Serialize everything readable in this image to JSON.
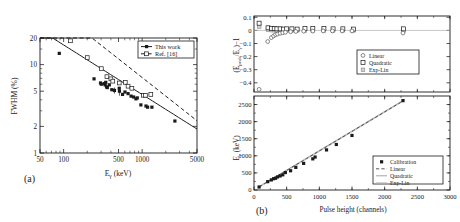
{
  "figure": {
    "caption_a": "(a)",
    "caption_b": "(b)"
  },
  "chart_data": [
    {
      "id": "panel-a",
      "type": "scatter",
      "panel_label": "(a)",
      "title": "",
      "xlabel": "Eγ (keV)",
      "xlabel_base": "E",
      "xlabel_sub": "γ",
      "xlabel_unit": " (keV)",
      "ylabel": "FWHM (%)",
      "xscale": "log",
      "yscale": "log",
      "xlim": [
        50,
        5000
      ],
      "ylim": [
        1,
        20
      ],
      "xticks": [
        50,
        100,
        500,
        1000,
        5000
      ],
      "xticklabels": [
        "50",
        "100",
        "500",
        "1000",
        "5000"
      ],
      "yticks": [
        1,
        2,
        5,
        10,
        20
      ],
      "yticklabels": [
        "1",
        "2",
        "5",
        "10",
        "20"
      ],
      "grid": false,
      "legend_position": "upper-right",
      "series": [
        {
          "name": "This work",
          "marker": "filled-square",
          "line": "solid",
          "points": [
            {
              "x": 88,
              "y": 13.4
            },
            {
              "x": 244,
              "y": 6.9
            },
            {
              "x": 295,
              "y": 6.2
            },
            {
              "x": 302,
              "y": 6.0
            },
            {
              "x": 330,
              "y": 6.1
            },
            {
              "x": 338,
              "y": 5.9
            },
            {
              "x": 344,
              "y": 6.3
            },
            {
              "x": 352,
              "y": 5.6
            },
            {
              "x": 360,
              "y": 5.5
            },
            {
              "x": 382,
              "y": 5.9
            },
            {
              "x": 411,
              "y": 5.2
            },
            {
              "x": 444,
              "y": 5.1
            },
            {
              "x": 511,
              "y": 5.4
            },
            {
              "x": 514,
              "y": 5.0
            },
            {
              "x": 563,
              "y": 4.6
            },
            {
              "x": 605,
              "y": 4.9
            },
            {
              "x": 662,
              "y": 4.7
            },
            {
              "x": 723,
              "y": 4.4
            },
            {
              "x": 779,
              "y": 4.3
            },
            {
              "x": 834,
              "y": 4.1
            },
            {
              "x": 867,
              "y": 4.2
            },
            {
              "x": 964,
              "y": 3.5
            },
            {
              "x": 1120,
              "y": 3.4
            },
            {
              "x": 1173,
              "y": 3.3
            },
            {
              "x": 1332,
              "y": 3.3
            },
            {
              "x": 2614,
              "y": 2.3
            }
          ],
          "fit_label": "power-law"
        },
        {
          "name": "Ref. [16]",
          "marker": "open-square",
          "line": "dashed",
          "points": [
            {
              "x": 122,
              "y": 18.6
            },
            {
              "x": 200,
              "y": 12.0
            },
            {
              "x": 302,
              "y": 9.0
            },
            {
              "x": 356,
              "y": 7.3
            },
            {
              "x": 400,
              "y": 6.9
            },
            {
              "x": 423,
              "y": 6.5
            },
            {
              "x": 511,
              "y": 6.2
            },
            {
              "x": 610,
              "y": 6.3
            },
            {
              "x": 662,
              "y": 5.7
            },
            {
              "x": 740,
              "y": 5.4
            },
            {
              "x": 1040,
              "y": 4.5
            },
            {
              "x": 1100,
              "y": 4.5
            },
            {
              "x": 1290,
              "y": 4.6
            }
          ],
          "fit_label": "power-law"
        }
      ],
      "legend": [
        {
          "label": "This work",
          "marker": "filled-square",
          "line": "solid"
        },
        {
          "label": "Ref. [16]",
          "marker": "open-square",
          "line": "dashed"
        }
      ]
    },
    {
      "id": "panel-b-top",
      "type": "scatter",
      "panel_label": "",
      "title": "",
      "xlabel": "",
      "ylabel": "(Epeak/Eγ)−1",
      "ylabel_p1": "(E",
      "ylabel_sub1": "peak",
      "ylabel_p2": "/E",
      "ylabel_sub2": "γ",
      "ylabel_p3": ")−1",
      "xscale": "linear",
      "yscale": "linear",
      "xlim": [
        0,
        3000
      ],
      "ylim": [
        -0.47,
        0.11
      ],
      "yticks": [
        0.1,
        0,
        -0.1,
        -0.2,
        -0.3,
        -0.4
      ],
      "yticklabels": [
        "0.1",
        "0",
        "−0.1",
        "−0.2",
        "−0.3",
        "−0.4"
      ],
      "xticks": [
        0,
        500,
        1000,
        1500,
        2000,
        2500,
        3000
      ],
      "grid": false,
      "legend_position": "lower-right",
      "series": [
        {
          "name": "Linear",
          "marker": "open-circle",
          "points": [
            {
              "x": 78,
              "y": -0.45
            },
            {
              "x": 210,
              "y": -0.085
            },
            {
              "x": 265,
              "y": -0.055
            },
            {
              "x": 300,
              "y": -0.042
            },
            {
              "x": 330,
              "y": -0.032
            },
            {
              "x": 360,
              "y": -0.028
            },
            {
              "x": 400,
              "y": -0.022
            },
            {
              "x": 440,
              "y": -0.018
            },
            {
              "x": 480,
              "y": -0.014
            },
            {
              "x": 560,
              "y": -0.01
            },
            {
              "x": 640,
              "y": -0.008
            },
            {
              "x": 760,
              "y": -0.006
            },
            {
              "x": 900,
              "y": -0.005
            },
            {
              "x": 1060,
              "y": -0.004
            },
            {
              "x": 1200,
              "y": -0.004
            },
            {
              "x": 1350,
              "y": -0.004
            },
            {
              "x": 1500,
              "y": -0.004
            },
            {
              "x": 2280,
              "y": -0.02
            }
          ]
        },
        {
          "name": "Quadratic",
          "marker": "open-square",
          "points": [
            {
              "x": 78,
              "y": 0.055
            },
            {
              "x": 215,
              "y": 0.02
            },
            {
              "x": 270,
              "y": 0.016
            },
            {
              "x": 310,
              "y": 0.014
            },
            {
              "x": 350,
              "y": 0.012
            },
            {
              "x": 400,
              "y": 0.012
            },
            {
              "x": 450,
              "y": 0.01
            },
            {
              "x": 500,
              "y": 0.012
            },
            {
              "x": 580,
              "y": 0.012
            },
            {
              "x": 660,
              "y": 0.01
            },
            {
              "x": 780,
              "y": 0.014
            },
            {
              "x": 900,
              "y": 0.014
            },
            {
              "x": 1070,
              "y": 0.014
            },
            {
              "x": 1210,
              "y": 0.012
            },
            {
              "x": 1360,
              "y": 0.012
            },
            {
              "x": 1520,
              "y": 0.01
            },
            {
              "x": 2290,
              "y": 0.012
            }
          ]
        },
        {
          "name": "Exp-Lin",
          "marker": "gray-square",
          "points": [
            {
              "x": 80,
              "y": 0.03
            },
            {
              "x": 215,
              "y": 0.004
            },
            {
              "x": 270,
              "y": 0.002
            },
            {
              "x": 310,
              "y": 0.002
            },
            {
              "x": 350,
              "y": 0.001
            },
            {
              "x": 400,
              "y": 0.0
            },
            {
              "x": 450,
              "y": 0.0
            },
            {
              "x": 500,
              "y": 0.0
            },
            {
              "x": 580,
              "y": 0.0
            },
            {
              "x": 660,
              "y": 0.0
            },
            {
              "x": 780,
              "y": 0.0
            },
            {
              "x": 900,
              "y": 0.0
            },
            {
              "x": 1070,
              "y": 0.0
            },
            {
              "x": 1210,
              "y": 0.0
            },
            {
              "x": 1360,
              "y": 0.0
            },
            {
              "x": 1520,
              "y": 0.0
            },
            {
              "x": 2290,
              "y": 0.0
            }
          ]
        }
      ],
      "legend": [
        {
          "label": "Linear",
          "marker": "open-circle"
        },
        {
          "label": "Quadratic",
          "marker": "open-square"
        },
        {
          "label": "Exp-Lin",
          "marker": "gray-square"
        }
      ]
    },
    {
      "id": "panel-b-bottom",
      "type": "scatter",
      "panel_label": "(b)",
      "title": "",
      "xlabel": "Pulse height (channels)",
      "ylabel": "Eγ (keV)",
      "ylabel_base": "E",
      "ylabel_sub": "γ",
      "ylabel_unit": " (keV)",
      "xscale": "linear",
      "yscale": "linear",
      "xlim": [
        0,
        3000
      ],
      "ylim": [
        0,
        2750
      ],
      "xticks": [
        0,
        500,
        1000,
        1500,
        2000,
        2500,
        3000
      ],
      "xticklabels": [
        "0",
        "500",
        "1000",
        "1500",
        "2000",
        "2500",
        "3000"
      ],
      "yticks": [
        0,
        500,
        1000,
        1500,
        2000,
        2500
      ],
      "yticklabels": [
        "0",
        "500",
        "1000",
        "1500",
        "2000",
        "2500"
      ],
      "grid": false,
      "legend_position": "lower-right",
      "series": [
        {
          "name": "Calibration",
          "marker": "filled-square",
          "points": [
            {
              "x": 78,
              "y": 88
            },
            {
              "x": 210,
              "y": 244
            },
            {
              "x": 265,
              "y": 295
            },
            {
              "x": 300,
              "y": 330
            },
            {
              "x": 330,
              "y": 344
            },
            {
              "x": 360,
              "y": 382
            },
            {
              "x": 400,
              "y": 411
            },
            {
              "x": 440,
              "y": 444
            },
            {
              "x": 480,
              "y": 511
            },
            {
              "x": 560,
              "y": 563
            },
            {
              "x": 640,
              "y": 662
            },
            {
              "x": 760,
              "y": 779
            },
            {
              "x": 900,
              "y": 911
            },
            {
              "x": 935,
              "y": 964
            },
            {
              "x": 1110,
              "y": 1173
            },
            {
              "x": 1260,
              "y": 1332
            },
            {
              "x": 1500,
              "y": 1596
            },
            {
              "x": 2280,
              "y": 2614
            }
          ]
        },
        {
          "name": "Linear",
          "marker": "none",
          "line": "dashed"
        },
        {
          "name": "Quadratic",
          "marker": "none",
          "line": "gray"
        },
        {
          "name": "Exp-Lin",
          "marker": "none",
          "line": "gray-light"
        }
      ],
      "legend": [
        {
          "label": "Calibration",
          "marker": "filled-square"
        },
        {
          "label": "Linear",
          "marker": "dash-line"
        },
        {
          "label": "Quadratic",
          "marker": "gray-line"
        },
        {
          "label": "Exp-Lin",
          "marker": "gray-line-2"
        }
      ]
    }
  ]
}
